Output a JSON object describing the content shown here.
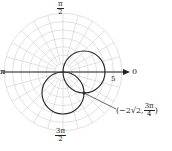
{
  "diagram": {
    "type": "polar-plot",
    "center_px": [
      63,
      72
    ],
    "grid": {
      "rings": 7,
      "ring_spacing_px": 8.4,
      "radial_step_deg": 15,
      "color": "#c8c8c8"
    },
    "curves": [
      {
        "name": "circle-right",
        "center_px": [
          84,
          72
        ],
        "radius_px": 21,
        "color": "#222222"
      },
      {
        "name": "circle-down",
        "center_px": [
          63,
          93
        ],
        "radius_px": 21,
        "color": "#222222"
      }
    ],
    "intersection_point_px": [
      84,
      93
    ]
  },
  "labels": {
    "top": {
      "num": "π",
      "den": "2"
    },
    "bottom": {
      "num": "3π",
      "den": "2"
    },
    "left": "π",
    "right": "0",
    "tick_5": "5",
    "point": {
      "prefix": "(−2√2, ",
      "num": "3π",
      "den": "4",
      "suffix": ")"
    }
  }
}
